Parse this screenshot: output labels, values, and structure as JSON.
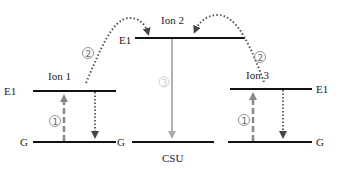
{
  "diagram": {
    "type": "energy-level transfer diagram",
    "colors": {
      "level_line": "#111111",
      "dashed_arrow": "#888888",
      "dotted_arrow": "#555555",
      "transfer_arrow": "#999999",
      "label": "#222222",
      "step_marker": "#666666"
    },
    "ions": [
      {
        "name": "Ion 1",
        "upper_label": "E1",
        "ground_label": "G",
        "step_label": "①"
      },
      {
        "name": "Ion 2",
        "upper_label": "E1",
        "step_label": "③"
      },
      {
        "name": "Ion 3",
        "upper_label": "E1",
        "ground_label": "G",
        "step_label": "①"
      }
    ],
    "csu": {
      "label": "CSU",
      "ground_label": "G"
    },
    "transfer_steps": [
      {
        "from": "Ion 1",
        "to": "Ion 2",
        "label": "②"
      },
      {
        "from": "Ion 3",
        "to": "Ion 2",
        "label": "②"
      }
    ]
  }
}
